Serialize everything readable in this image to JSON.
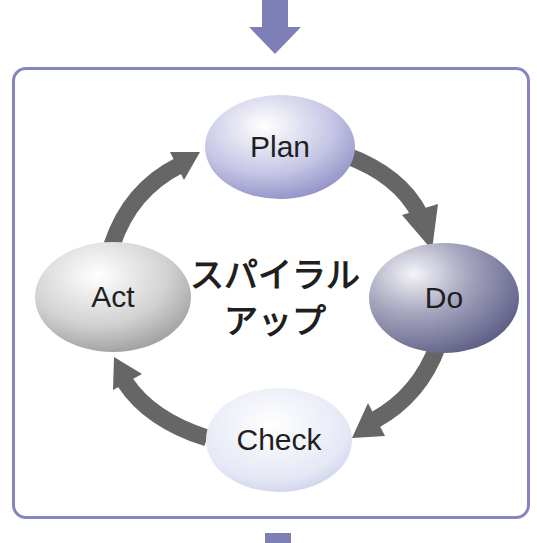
{
  "diagram": {
    "type": "cycle",
    "nodes": [
      {
        "id": "plan",
        "label": "Plan",
        "color": "#b9b9e0"
      },
      {
        "id": "do",
        "label": "Do",
        "color": "#8d8dae"
      },
      {
        "id": "check",
        "label": "Check",
        "color": "#dfe2f2"
      },
      {
        "id": "act",
        "label": "Act",
        "color": "#c9c9c9"
      }
    ],
    "edges": [
      {
        "from": "plan",
        "to": "do"
      },
      {
        "from": "do",
        "to": "check"
      },
      {
        "from": "check",
        "to": "act"
      },
      {
        "from": "act",
        "to": "plan"
      }
    ],
    "center_label": {
      "line1": "スパイラル",
      "line2": "アップ"
    },
    "colors": {
      "frame": "#8585bf",
      "flow_arrow": "#7f7fb8",
      "cycle_arrow": "#666666"
    }
  }
}
